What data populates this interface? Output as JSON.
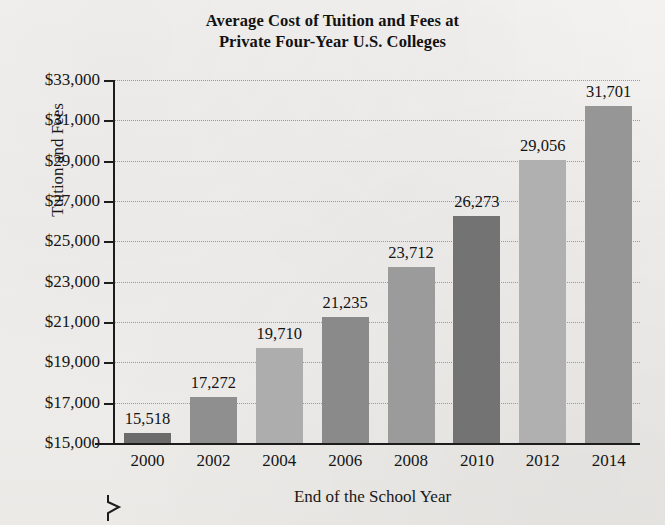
{
  "title": {
    "line1": "Average Cost of Tuition and Fees at",
    "line2": "Private Four-Year U.S. Colleges"
  },
  "axes": {
    "ylabel": "Tuition and Fees",
    "xlabel": "End of the School Year"
  },
  "chart_data": {
    "type": "bar",
    "title": "Average Cost of Tuition and Fees at Private Four-Year U.S. Colleges",
    "xlabel": "End of the School Year",
    "ylabel": "Tuition and Fees",
    "categories": [
      "2000",
      "2002",
      "2004",
      "2006",
      "2008",
      "2010",
      "2012",
      "2014"
    ],
    "values": [
      15518,
      17272,
      19710,
      21235,
      23712,
      26273,
      29056,
      31701
    ],
    "value_labels": [
      "15,518",
      "17,272",
      "19,710",
      "21,235",
      "23,712",
      "26,273",
      "29,056",
      "31,701"
    ],
    "ylim": [
      15000,
      33000
    ],
    "ytick_values": [
      15000,
      17000,
      19000,
      21000,
      23000,
      25000,
      27000,
      29000,
      31000,
      33000
    ],
    "ytick_labels": [
      "$15,000",
      "$17,000",
      "$19,000",
      "$21,000",
      "$23,000",
      "$25,000",
      "$27,000",
      "$29,000",
      "$31,000",
      "$33,000"
    ],
    "ytick_step": 2000,
    "axis_break": true,
    "grid": "horizontal-dotted",
    "legend": "none",
    "bar_colors": [
      "#6b6b6b",
      "#8f8f8f",
      "#adadad",
      "#8a8a8a",
      "#9b9b9b",
      "#737373",
      "#b0b0b0",
      "#969696"
    ]
  }
}
